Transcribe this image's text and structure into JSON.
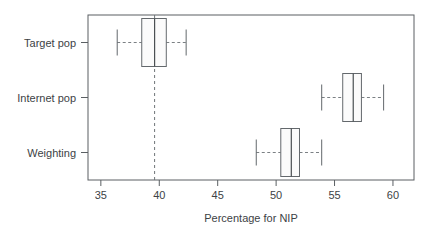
{
  "figure": {
    "width": 438,
    "height": 233,
    "background": "#ffffff",
    "foreground": "#3d4245"
  },
  "chart_data": {
    "type": "box",
    "title": "",
    "subtitle": "",
    "xlabel": "Percentage for NIP",
    "ylabel": "",
    "xlim": [
      33.9,
      61.8
    ],
    "xticks": [
      35,
      40,
      45,
      50,
      55,
      60
    ],
    "xtick_labels": [
      "35",
      "40",
      "45",
      "50",
      "55",
      "60"
    ],
    "categories": [
      "Target pop",
      "Internet pop",
      "Weighting"
    ],
    "grid": false,
    "legend": "none",
    "orientation": "horizontal",
    "reference_line": {
      "name": "target-pop-median-reference",
      "value": 39.6,
      "style": "dashed",
      "color": "#6f7478"
    },
    "boxes": [
      {
        "category": "Target pop",
        "whisker_low": 36.4,
        "q1": 38.5,
        "median": 39.6,
        "q3": 40.6,
        "whisker_high": 42.3
      },
      {
        "category": "Internet pop",
        "whisker_low": 53.9,
        "q1": 55.7,
        "median": 56.6,
        "q3": 57.3,
        "whisker_high": 59.2
      },
      {
        "category": "Weighting",
        "whisker_low": 48.3,
        "q1": 50.4,
        "median": 51.3,
        "q3": 52.0,
        "whisker_high": 53.9
      }
    ]
  }
}
